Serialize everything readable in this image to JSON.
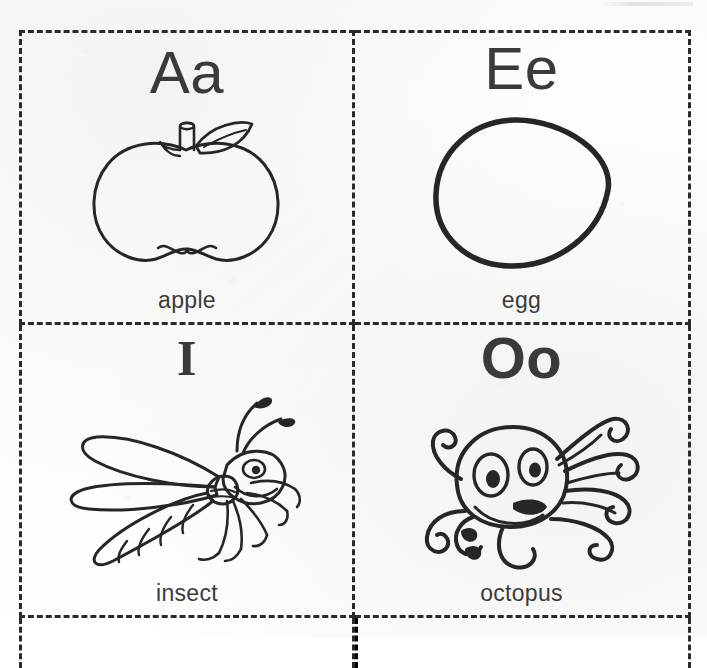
{
  "worksheet": {
    "title": "Alphabet Flashcards",
    "background_color": "#ffffff",
    "ink_color": "#262626",
    "border_color": "#2a2a2a",
    "border_style": "dashed",
    "grid": {
      "columns": 2,
      "rows": 2,
      "partial_row_at_bottom": true
    }
  },
  "cards": [
    {
      "id": "card-a",
      "letter": "Aa",
      "uppercase": "A",
      "lowercase": "a",
      "caption": "apple",
      "illustration": "apple-line-drawing",
      "position": {
        "row": 0,
        "column": 0
      }
    },
    {
      "id": "card-e",
      "letter": "Ee",
      "uppercase": "E",
      "lowercase": "e",
      "caption": "egg",
      "illustration": "egg-line-drawing",
      "position": {
        "row": 0,
        "column": 1
      }
    },
    {
      "id": "card-i",
      "letter": "I",
      "uppercase": "I",
      "lowercase": "",
      "caption": "insect",
      "illustration": "insect-line-drawing",
      "position": {
        "row": 1,
        "column": 0
      }
    },
    {
      "id": "card-o",
      "letter": "Oo",
      "uppercase": "O",
      "lowercase": "o",
      "caption": "octopus",
      "illustration": "octopus-line-drawing",
      "position": {
        "row": 1,
        "column": 1
      }
    }
  ]
}
